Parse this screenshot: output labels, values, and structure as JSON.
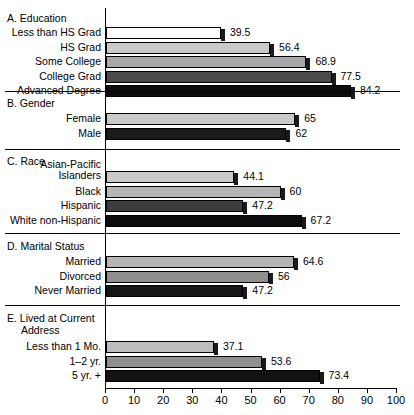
{
  "chart_data": {
    "type": "bar",
    "orientation": "horizontal",
    "title": "",
    "xlabel": "",
    "ylabel": "",
    "xlim": [
      0,
      100
    ],
    "xticks": [
      0,
      10,
      20,
      30,
      40,
      50,
      60,
      70,
      80,
      90,
      100
    ],
    "grid": false,
    "legend": null,
    "groups": [
      {
        "key": "A",
        "title": "A. Education",
        "categories": [
          "Less than HS Grad",
          "HS Grad",
          "Some College",
          "College Grad",
          "Advanced Degree"
        ],
        "values": [
          39.5,
          56.4,
          68.9,
          77.5,
          84.2
        ],
        "value_labels": [
          "39.5",
          "56.4",
          "68.9",
          "77.5",
          "84.2"
        ],
        "fills": [
          "#ffffff",
          "#c9c9c9",
          "#a8a8a8",
          "#4a4a4a",
          "#0d0d0d"
        ]
      },
      {
        "key": "B",
        "title": "B. Gender",
        "categories": [
          "Female",
          "Male"
        ],
        "values": [
          65,
          62
        ],
        "value_labels": [
          "65",
          "62"
        ],
        "fills": [
          "#c9c9c9",
          "#1a1a1a"
        ]
      },
      {
        "key": "C",
        "title": "C. Race",
        "categories": [
          "Asian-Pacific\nIslanders",
          "Black",
          "Hispanic",
          "White non-Hispanic"
        ],
        "values": [
          44.1,
          60,
          47.2,
          67.2
        ],
        "value_labels": [
          "44.1",
          "60",
          "47.2",
          "67.2"
        ],
        "fills": [
          "#c9c9c9",
          "#b5b5b5",
          "#3d3d3d",
          "#0d0d0d"
        ]
      },
      {
        "key": "D",
        "title": "D. Marital Status",
        "categories": [
          "Married",
          "Divorced",
          "Never Married"
        ],
        "values": [
          64.6,
          56,
          47.2
        ],
        "value_labels": [
          "64.6",
          "56",
          "47.2"
        ],
        "fills": [
          "#b5b5b5",
          "#8f8f8f",
          "#151515"
        ]
      },
      {
        "key": "E",
        "title": "E. Lived at Current\nAddress",
        "categories": [
          "Less than 1 Mo.",
          "1–2 yr.",
          "5 yr. +"
        ],
        "values": [
          37.1,
          53.6,
          73.4
        ],
        "value_labels": [
          "37.1",
          "53.6",
          "73.4"
        ],
        "fills": [
          "#bdbdbd",
          "#8f8f8f",
          "#121212"
        ]
      }
    ]
  },
  "axis": {
    "tick_labels": [
      "0",
      "10",
      "20",
      "30",
      "40",
      "50",
      "60",
      "70",
      "80",
      "90",
      "100"
    ]
  },
  "sections": {
    "a_title": "A. Education",
    "b_title": "B. Gender",
    "c_title": "C. Race",
    "d_title": "D. Marital Status",
    "e_title_line1": "E. Lived at Current",
    "e_title_line2": "Address"
  }
}
